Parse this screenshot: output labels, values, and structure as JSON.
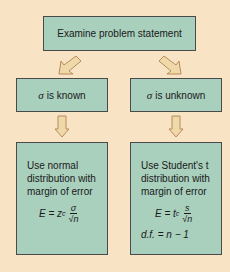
{
  "colors": {
    "background": "#f8e4c4",
    "box_fill": "#a9cfbd",
    "box_border": "#4a4a4a",
    "arrow_fill": "#f0d9a8",
    "arrow_stroke": "#b88a5a"
  },
  "top": {
    "label": "Examine problem statement"
  },
  "left_branch": {
    "sigma": "σ",
    "condition": "is known",
    "description": [
      "Use normal",
      "distribution with",
      "margin of error"
    ],
    "formula": {
      "lhs": "E = z",
      "sub": "c",
      "numerator": "σ",
      "denominator": "√n"
    }
  },
  "right_branch": {
    "sigma": "σ",
    "condition": "is unknown",
    "description": [
      "Use Student's t",
      "distribution with",
      "margin of error"
    ],
    "formula": {
      "lhs": "E = t",
      "sub": "c",
      "numerator": "s",
      "denominator": "√n"
    },
    "df": "d.f. = n − 1"
  }
}
